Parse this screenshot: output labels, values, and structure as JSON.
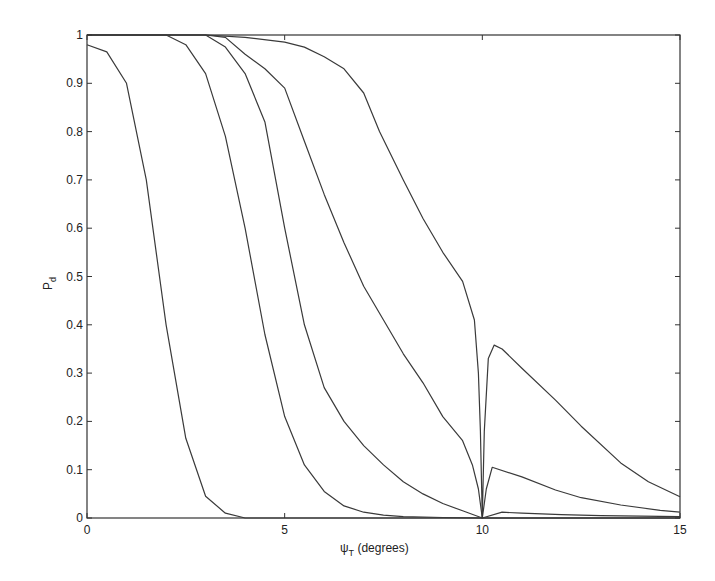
{
  "chart_data": {
    "type": "line",
    "title": "",
    "xlabel": "ψT (degrees)",
    "xlabel_main": "ψ",
    "xlabel_sub": "T",
    "xlabel_rest": " (degrees)",
    "ylabel": "Pd",
    "ylabel_main": "P",
    "ylabel_sub": "d",
    "xlim": [
      0,
      15
    ],
    "ylim": [
      0,
      1
    ],
    "grid": false,
    "legend": null,
    "xticks": [
      0,
      5,
      10,
      15
    ],
    "xtick_labels": [
      "0",
      "5",
      "10",
      "15"
    ],
    "yticks": [
      0,
      0.1,
      0.2,
      0.3,
      0.4,
      0.5,
      0.6,
      0.7,
      0.8,
      0.9,
      1
    ],
    "ytick_labels": [
      "0",
      "0.1",
      "0.2",
      "0.3",
      "0.4",
      "0.5",
      "0.6",
      "0.7",
      "0.8",
      "0.9",
      "1"
    ],
    "series": [
      {
        "name": "curve-1",
        "x": [
          0,
          0.5,
          1,
          1.5,
          2,
          2.5,
          3,
          3.5,
          4,
          5,
          10,
          15
        ],
        "y": [
          0.98,
          0.965,
          0.9,
          0.7,
          0.4,
          0.165,
          0.045,
          0.01,
          0.0,
          0.0,
          0.0,
          0.0
        ]
      },
      {
        "name": "curve-2",
        "x": [
          0,
          1,
          2,
          2.5,
          3,
          3.5,
          4,
          4.5,
          5,
          5.5,
          6,
          6.5,
          7,
          7.5,
          8,
          9,
          10,
          15
        ],
        "y": [
          1.0,
          1.0,
          1.0,
          0.98,
          0.92,
          0.79,
          0.6,
          0.38,
          0.21,
          0.11,
          0.055,
          0.025,
          0.012,
          0.006,
          0.003,
          0.001,
          0.0,
          0.0
        ]
      },
      {
        "name": "curve-3",
        "x": [
          0,
          2,
          3,
          3.5,
          4,
          4.5,
          5,
          5.5,
          6,
          6.5,
          7,
          7.5,
          8,
          8.5,
          9,
          9.5,
          10,
          10.5,
          11,
          12,
          13,
          15
        ],
        "y": [
          1.0,
          1.0,
          1.0,
          0.975,
          0.92,
          0.82,
          0.6,
          0.4,
          0.27,
          0.2,
          0.15,
          0.11,
          0.075,
          0.05,
          0.03,
          0.015,
          0.0,
          0.012,
          0.01,
          0.007,
          0.005,
          0.003
        ]
      },
      {
        "name": "curve-4",
        "x": [
          0,
          3,
          3.5,
          4,
          4.5,
          5,
          5.5,
          6,
          6.5,
          7,
          7.5,
          8,
          8.5,
          9,
          9.5,
          9.75,
          9.9,
          10,
          10.1,
          10.25,
          11,
          11.85,
          12.5,
          13.5,
          14.5,
          15
        ],
        "y": [
          1.0,
          1.0,
          0.995,
          0.96,
          0.93,
          0.89,
          0.78,
          0.67,
          0.57,
          0.48,
          0.41,
          0.34,
          0.28,
          0.21,
          0.16,
          0.11,
          0.06,
          0.0,
          0.06,
          0.105,
          0.085,
          0.058,
          0.042,
          0.027,
          0.016,
          0.012
        ]
      },
      {
        "name": "curve-5",
        "x": [
          0,
          3,
          4,
          5,
          5.5,
          6,
          6.5,
          7,
          7.4,
          8,
          8.5,
          9,
          9.5,
          9.8,
          9.9,
          9.95,
          10,
          10.05,
          10.15,
          10.3,
          10.5,
          11,
          11.85,
          12.5,
          13.5,
          14.2,
          15
        ],
        "y": [
          1.0,
          1.0,
          0.995,
          0.985,
          0.975,
          0.955,
          0.93,
          0.88,
          0.8,
          0.7,
          0.62,
          0.55,
          0.49,
          0.41,
          0.3,
          0.18,
          0.0,
          0.18,
          0.33,
          0.358,
          0.35,
          0.31,
          0.244,
          0.19,
          0.114,
          0.075,
          0.044
        ]
      }
    ],
    "colors": {
      "line": "#3a3a3a",
      "axis": "#333333",
      "background": "#ffffff"
    }
  }
}
